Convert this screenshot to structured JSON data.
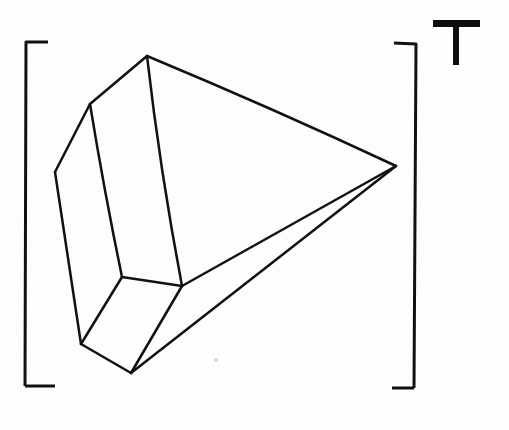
{
  "canvas": {
    "width": 509,
    "height": 430,
    "background_color": "#fdfdfd",
    "ink_color": "#111111"
  },
  "figure": {
    "title": "T",
    "kind": "hand-drawn 3d polyhedron line drawing",
    "description": "A faceted wedge-like solid shown in oblique perspective, enclosed by hand-drawn corner brackets",
    "stroke_width": 2.5
  },
  "label": {
    "text": "T",
    "color": "#0d0d0d",
    "position": {
      "x": 456,
      "y": 42
    },
    "bar": {
      "x": 433,
      "y": 20,
      "width": 47,
      "height": 7
    },
    "stem": {
      "x": 453,
      "y": 20,
      "width": 6,
      "height": 45
    }
  },
  "brackets": {
    "stroke_width": 3.0,
    "color": "#111111",
    "top_left": {
      "path": "M 48 42 L 26 42 L 25 386"
    },
    "bottom_left": {
      "path": "M 25 386 L 55 386"
    },
    "top_right": {
      "path": "M 394 43 L 416 44 L 414 388"
    },
    "bottom_right": {
      "path": "M 414 388 L 392 388"
    }
  },
  "vertices": {
    "top_apex": {
      "x": 147,
      "y": 56,
      "name": "top-apex"
    },
    "upper_left": {
      "x": 90,
      "y": 104,
      "name": "upper-left-shoulder"
    },
    "left_mid": {
      "x": 55,
      "y": 172,
      "name": "left-mid-corner"
    },
    "right_apex": {
      "x": 396,
      "y": 166,
      "name": "right-apex"
    },
    "inner_left_low": {
      "x": 122,
      "y": 277,
      "name": "inner-left-lower"
    },
    "inner_right_low": {
      "x": 182,
      "y": 286,
      "name": "inner-right-lower"
    },
    "bottom_left": {
      "x": 81,
      "y": 344,
      "name": "bottom-left-corner"
    },
    "bottom_apex": {
      "x": 131,
      "y": 373,
      "name": "bottom-apex"
    }
  },
  "edges": [
    {
      "name": "apex-to-upper-left",
      "path": "M 147 56 L 90 104"
    },
    {
      "name": "apex-to-right-apex",
      "path": "M 147 56 Q 272 108 396 166"
    },
    {
      "name": "apex-to-inner-right",
      "path": "M 147 56 Q 160 170 182 286"
    },
    {
      "name": "upper-left-to-left-mid",
      "path": "M 90 104 L 55 172"
    },
    {
      "name": "upper-left-to-inner-left",
      "path": "M 90 104 Q 104 190 122 277"
    },
    {
      "name": "left-mid-to-bottom-left",
      "path": "M 55 172 Q 68 258 81 344"
    },
    {
      "name": "inner-left-to-inner-right",
      "path": "M 122 277 L 182 286"
    },
    {
      "name": "inner-left-to-bottom-left",
      "path": "M 122 277 L 81 344"
    },
    {
      "name": "bottom-left-to-bottom-apex",
      "path": "M 81 344 L 131 373"
    },
    {
      "name": "inner-right-to-bottom-apex",
      "path": "M 182 286 L 131 373"
    },
    {
      "name": "inner-right-to-right-apex",
      "path": "M 182 286 Q 289 226 396 166"
    },
    {
      "name": "bottom-apex-to-right-apex",
      "path": "M 131 373 Q 263 270 396 166"
    }
  ],
  "artifacts": [
    {
      "name": "paper-speck",
      "x": 216,
      "y": 360,
      "radius": 2,
      "color": "#d8d8d8"
    }
  ]
}
